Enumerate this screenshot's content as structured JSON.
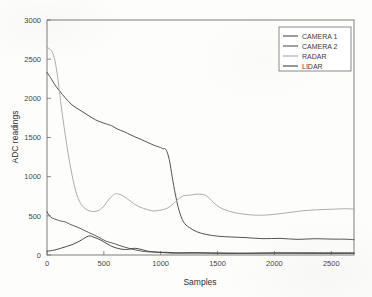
{
  "chart_data": {
    "type": "line",
    "title": "",
    "xlabel": "Samples",
    "ylabel": "ADC readings",
    "xlim": [
      0,
      2700
    ],
    "ylim": [
      0,
      3000
    ],
    "xticks": [
      0,
      500,
      1000,
      1500,
      2000,
      2500
    ],
    "yticks": [
      0,
      500,
      1000,
      1500,
      2000,
      2500,
      3000
    ],
    "xticklabels": [
      "0",
      "500",
      "1000",
      "1500",
      "2000",
      "2500"
    ],
    "yticklabels": [
      "0",
      "500",
      "1000",
      "1500",
      "2000",
      "2500",
      "3000"
    ],
    "grid": false,
    "legend_position": "upper right",
    "series": [
      {
        "name": "CAMERA 1",
        "color": "#4a4a4a",
        "x": [
          0,
          20,
          40,
          70,
          110,
          160,
          220,
          290,
          360,
          430,
          500,
          560,
          580,
          620,
          680,
          740,
          800,
          870,
          940,
          1000,
          1020,
          1040,
          1060,
          1080,
          1100,
          1130,
          1160,
          1200,
          1250,
          1320,
          1400,
          1500,
          1620,
          1750,
          1900,
          2050,
          2200,
          2350,
          2500,
          2620,
          2700
        ],
        "y": [
          2330,
          2290,
          2240,
          2170,
          2090,
          2000,
          1920,
          1850,
          1790,
          1730,
          1680,
          1650,
          1640,
          1610,
          1570,
          1530,
          1490,
          1450,
          1405,
          1370,
          1360,
          1355,
          1300,
          1180,
          1000,
          760,
          580,
          430,
          350,
          295,
          265,
          245,
          230,
          222,
          215,
          210,
          206,
          203,
          201,
          200,
          200
        ]
      },
      {
        "name": "CAMERA 2",
        "color": "#555555",
        "x": [
          0,
          20,
          50,
          90,
          130,
          160,
          175,
          200,
          240,
          290,
          340,
          390,
          450,
          520,
          590,
          660,
          730,
          800,
          860,
          920,
          1000,
          1100,
          1300,
          1600,
          2000,
          2400,
          2700
        ],
        "y": [
          552,
          500,
          468,
          448,
          432,
          428,
          415,
          400,
          372,
          340,
          305,
          268,
          225,
          180,
          140,
          108,
          80,
          58,
          46,
          38,
          30,
          26,
          24,
          23,
          22,
          22,
          22
        ]
      },
      {
        "name": "RADAR",
        "color": "#a8a8a8",
        "x": [
          0,
          20,
          45,
          70,
          95,
          120,
          150,
          185,
          220,
          255,
          285,
          310,
          340,
          380,
          420,
          460,
          500,
          540,
          570,
          600,
          640,
          680,
          720,
          770,
          820,
          880,
          930,
          970,
          1010,
          1060,
          1110,
          1150,
          1200,
          1260,
          1320,
          1370,
          1400,
          1430,
          1470,
          1520,
          1580,
          1650,
          1720,
          1800,
          1880,
          1960,
          2050,
          2150,
          2260,
          2380,
          2500,
          2620,
          2700
        ],
        "y": [
          2650,
          2640,
          2600,
          2480,
          2250,
          1960,
          1640,
          1300,
          1020,
          810,
          690,
          625,
          590,
          565,
          560,
          575,
          620,
          700,
          755,
          778,
          770,
          740,
          700,
          655,
          615,
          585,
          568,
          562,
          570,
          600,
          655,
          710,
          752,
          765,
          770,
          772,
          758,
          720,
          665,
          612,
          568,
          535,
          518,
          508,
          505,
          512,
          528,
          548,
          565,
          578,
          586,
          590,
          590
        ]
      },
      {
        "name": "LIDAR",
        "color": "#3f3f3f",
        "x": [
          0,
          30,
          70,
          120,
          170,
          220,
          270,
          310,
          350,
          380,
          410,
          450,
          500,
          560,
          620,
          680,
          720,
          760,
          800,
          850,
          900,
          980,
          1060,
          1150,
          1300,
          1500,
          1750,
          2000,
          2250,
          2500,
          2700
        ],
        "y": [
          48,
          55,
          68,
          86,
          108,
          132,
          165,
          198,
          228,
          240,
          232,
          205,
          165,
          120,
          85,
          68,
          72,
          82,
          78,
          60,
          45,
          36,
          32,
          30,
          28,
          27,
          26,
          26,
          25,
          25,
          25
        ]
      }
    ]
  },
  "legend": {
    "entries": [
      {
        "label": "CAMERA 1"
      },
      {
        "label": "CAMERA 2"
      },
      {
        "label": "RADAR"
      },
      {
        "label": "LIDAR"
      }
    ]
  }
}
